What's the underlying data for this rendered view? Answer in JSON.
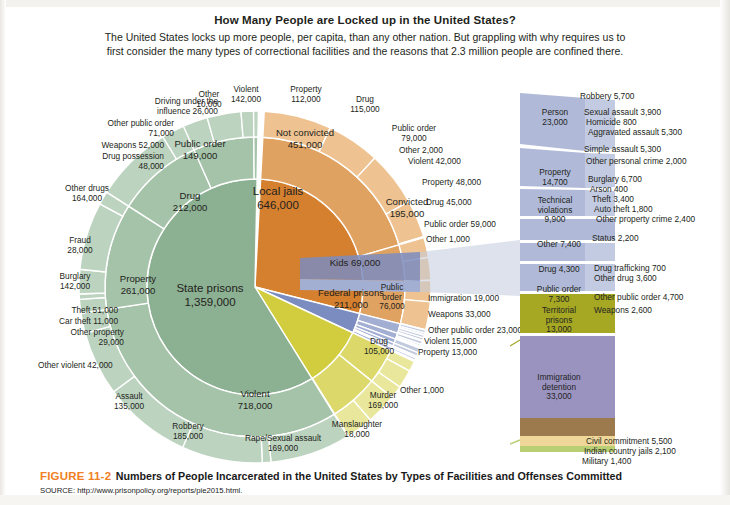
{
  "header": {
    "title": "How Many People are Locked up in the United States?",
    "subtitle": "The United States locks up more people, per capita, than any other nation. But grappling with why requires us to first consider the many types of correctional facilities and the reasons that 2.3 million people are confined there."
  },
  "figure": {
    "number": "FIGURE 11-2",
    "caption": "Numbers of  People Incarcerated in the United States by Types of Facilities and Offenses Committed",
    "source": "SOURCE: http://www.prisonpolicy.org/reports/pie2015.html."
  },
  "colors": {
    "state_prisons": "#8cb092",
    "state_prisons_mid": "#a5c3a9",
    "state_prisons_outer": "#bcd3bf",
    "local_jails": "#d4802f",
    "local_jails_mid": "#e0a261",
    "local_jails_outer": "#eec391",
    "federal_prisons": "#d2cd3e",
    "federal_prisons_mid": "#dcd96a",
    "federal_prisons_outer": "#e9e79b",
    "kids": "#7b8cc0",
    "kids_light": "#a3aed3",
    "kids_lighter": "#c2cade",
    "territorial": "#a6a824",
    "immigration": "#9a93c0",
    "civil_commitment": "#9d7a4e",
    "indian_country": "#efd79a",
    "military": "#b9cf74",
    "figure_accent": "#f08022"
  },
  "chart_data": {
    "type": "pie",
    "title": "How Many People are Locked up in the United States?",
    "total": "2.3 million",
    "rings": [
      "facility",
      "offense_category",
      "offense_detail"
    ],
    "facilities": [
      {
        "name": "State prisons",
        "value": 1359000,
        "color": "#8cb092",
        "categories": [
          {
            "name": "Violent",
            "value": 718000,
            "details": [
              {
                "name": "Murder",
                "value": 169000
              },
              {
                "name": "Manslaughter",
                "value": 18000
              },
              {
                "name": "Rape/Sexual assault",
                "value": 169000
              },
              {
                "name": "Robbery",
                "value": 185000
              },
              {
                "name": "Assault",
                "value": 135000
              },
              {
                "name": "Other violent",
                "value": 42000
              }
            ]
          },
          {
            "name": "Property",
            "value": 261000,
            "details": [
              {
                "name": "Other property",
                "value": 29000
              },
              {
                "name": "Car theft",
                "value": 11000
              },
              {
                "name": "Theft",
                "value": 51000
              },
              {
                "name": "Burglary",
                "value": 142000
              },
              {
                "name": "Fraud",
                "value": 28000
              }
            ]
          },
          {
            "name": "Drug",
            "value": 212000,
            "details": [
              {
                "name": "Other drugs",
                "value": 164000
              },
              {
                "name": "Drug possession",
                "value": 48000
              }
            ]
          },
          {
            "name": "Public order",
            "value": 149000,
            "details": [
              {
                "name": "Weapons",
                "value": 52000
              },
              {
                "name": "Other public order",
                "value": 71000
              },
              {
                "name": "Driving under the influence",
                "value": 26000
              }
            ]
          },
          {
            "name": "Other",
            "value": 10000,
            "details": []
          }
        ]
      },
      {
        "name": "Local jails",
        "value": 646000,
        "color": "#d4802f",
        "categories": [
          {
            "name": "Not convicted",
            "value": 451000,
            "details": [
              {
                "name": "Violent",
                "value": 142000
              },
              {
                "name": "Property",
                "value": 112000
              },
              {
                "name": "Drug",
                "value": 115000
              },
              {
                "name": "Public order",
                "value": 79000
              },
              {
                "name": "Other",
                "value": 2000
              }
            ]
          },
          {
            "name": "Convicted",
            "value": 195000,
            "details": [
              {
                "name": "Violent",
                "value": 42000
              },
              {
                "name": "Property",
                "value": 48000
              },
              {
                "name": "Drug",
                "value": 45000
              },
              {
                "name": "Public order",
                "value": 59000
              },
              {
                "name": "Other",
                "value": 1000
              }
            ]
          }
        ]
      },
      {
        "name": "Kids",
        "value": 69000,
        "color": "#7b8cc0",
        "categories": [
          {
            "name": "Person",
            "value": 23000,
            "details": [
              {
                "name": "Robbery",
                "value": 5700
              },
              {
                "name": "Sexual assault",
                "value": 3900
              },
              {
                "name": "Homicide",
                "value": 800
              },
              {
                "name": "Aggravated assault",
                "value": 5300
              },
              {
                "name": "Simple assault",
                "value": 5300
              },
              {
                "name": "Other personal crime",
                "value": 2000
              }
            ]
          },
          {
            "name": "Property",
            "value": 14700,
            "details": [
              {
                "name": "Burglary",
                "value": 6700
              },
              {
                "name": "Arson",
                "value": 400
              },
              {
                "name": "Theft",
                "value": 3400
              },
              {
                "name": "Auto theft",
                "value": 1800
              },
              {
                "name": "Other property crime",
                "value": 2400
              }
            ]
          },
          {
            "name": "Technical violations",
            "value": 9900,
            "details": [
              {
                "name": "Status",
                "value": 2200
              }
            ]
          },
          {
            "name": "Other",
            "value": 7400,
            "details": []
          },
          {
            "name": "Drug",
            "value": 4300,
            "details": [
              {
                "name": "Drug trafficking",
                "value": 700
              },
              {
                "name": "Other drug",
                "value": 3600
              }
            ]
          },
          {
            "name": "Public order",
            "value": 7300,
            "details": [
              {
                "name": "Other public order",
                "value": 4700
              },
              {
                "name": "Weapons",
                "value": 2600
              }
            ]
          }
        ]
      },
      {
        "name": "Federal prisons",
        "value": 211000,
        "color": "#d2cd3e",
        "categories": [
          {
            "name": "Public order",
            "value": 76000,
            "details": [
              {
                "name": "Immigration",
                "value": 19000
              },
              {
                "name": "Weapons",
                "value": 33000
              },
              {
                "name": "Other public order",
                "value": 23000
              }
            ]
          },
          {
            "name": "Drug",
            "value": 105000,
            "details": [
              {
                "name": "Violent",
                "value": 15000
              },
              {
                "name": "Property",
                "value": 13000
              }
            ]
          },
          {
            "name": "Other",
            "value": 1000,
            "details": []
          }
        ]
      },
      {
        "name": "Territorial prisons",
        "value": 13000,
        "color": "#a6a824",
        "categories": []
      },
      {
        "name": "Immigration detention",
        "value": 33000,
        "color": "#9a93c0",
        "categories": []
      },
      {
        "name": "Civil commitment",
        "value": 5500,
        "color": "#9d7a4e",
        "categories": []
      },
      {
        "name": "Indian country jails",
        "value": 2100,
        "color": "#efd79a",
        "categories": []
      },
      {
        "name": "Military",
        "value": 1400,
        "color": "#b9cf74",
        "categories": []
      }
    ]
  },
  "labels": {
    "ring_center": {
      "state_prisons": "State prisons",
      "state_prisons_val": "1,359,000",
      "local_jails": "Local jails",
      "local_jails_val": "646,000",
      "federal_prisons": "Federal prisons",
      "federal_prisons_val": "211,000",
      "kids": "Kids 69,000"
    },
    "state": {
      "violent": "Violent",
      "violent_val": "718,000",
      "property": "Property",
      "property_val": "261,000",
      "drug": "Drug",
      "drug_val": "212,000",
      "public_order": "Public order",
      "public_order_val": "149,000",
      "other": "Other",
      "other_val": "10,000",
      "dui": "Driving under the",
      "dui_val": "influence 26,000",
      "other_public_order": "Other public order",
      "other_public_order_val": "71,000",
      "weapons": "Weapons 52,000",
      "drug_possession": "Drug possession",
      "drug_possession_val": "48,000",
      "other_drugs": "Other drugs",
      "other_drugs_val": "164,000",
      "fraud": "Fraud",
      "fraud_val": "28,000",
      "burglary": "Burglary",
      "burglary_val": "142,000",
      "theft": "Theft 51,000",
      "car_theft": "Car theft 11,000",
      "other_property": "Other property",
      "other_property_val": "29,000",
      "other_violent": "Other violent 42,000",
      "assault": "Assault",
      "assault_val": "135,000",
      "robbery": "Robbery",
      "robbery_val": "185,000",
      "rape": "Rape/Sexual assault",
      "rape_val": "169,000",
      "manslaughter": "Manslaughter",
      "manslaughter_val": "18,000",
      "murder": "Murder",
      "murder_val": "169,000"
    },
    "jails": {
      "not_convicted": "Not convicted",
      "not_convicted_val": "451,000",
      "convicted": "Convicted",
      "convicted_val": "195,000",
      "nc_violent": "Violent",
      "nc_violent_val": "142,000",
      "nc_property": "Property",
      "nc_property_val": "112,000",
      "nc_drug": "Drug",
      "nc_drug_val": "115,000",
      "nc_public_order": "Public order",
      "nc_public_order_val": "79,000",
      "nc_other": "Other 2,000",
      "c_violent": "Violent 42,000",
      "c_property": "Property 48,000",
      "c_drug": "Drug 45,000",
      "c_public_order": "Public order 59,000",
      "c_other": "Other 1,000"
    },
    "federal": {
      "public_order": "Public",
      "public_order2": "order",
      "public_order_val": "76,000",
      "drug": "Drug",
      "drug_val": "105,000",
      "immigration": "Immigration 19,000",
      "weapons": "Weapons 33,000",
      "other_public_order": "Other public order 23,000",
      "violent": "Violent 15,000",
      "property": "Property 13,000",
      "other": "Other 1,000"
    },
    "kids_panel": {
      "person": "Person",
      "person_val": "23,000",
      "property": "Property",
      "property_val": "14,700",
      "technical": "Technical",
      "technical2": "violations",
      "technical_val": "9,900",
      "other": "Other 7,400",
      "drug": "Drug 4,300",
      "public_order": "Public order",
      "public_order_val": "7,300",
      "territorial": "Territorial",
      "territorial2": "prisons",
      "territorial_val": "13,000",
      "immigration": "Immigration",
      "immigration2": "detention",
      "immigration_val": "33,000",
      "robbery": "Robbery 5,700",
      "sexual_assault": "Sexual assault 3,900",
      "homicide": "Homicide 800",
      "aggravated": "Aggravated assault 5,300",
      "simple_assault": "Simple assault 5,300",
      "other_personal": "Other personal crime 2,000",
      "burglary": "Burglary 6,700",
      "arson": "Arson 400",
      "theft": "Theft 3,400",
      "auto_theft": "Auto theft 1,800",
      "other_property": "Other property crime 2,400",
      "status": "Status 2,200",
      "drug_trafficking": "Drug trafficking 700",
      "other_drug": "Other drug 3,600",
      "other_public_order": "Other public order 4,700",
      "weapons": "Weapons 2,600",
      "civil_commitment": "Civil commitment 5,500",
      "indian_country": "Indian country jails 2,100",
      "military": "Military 1,400"
    }
  }
}
